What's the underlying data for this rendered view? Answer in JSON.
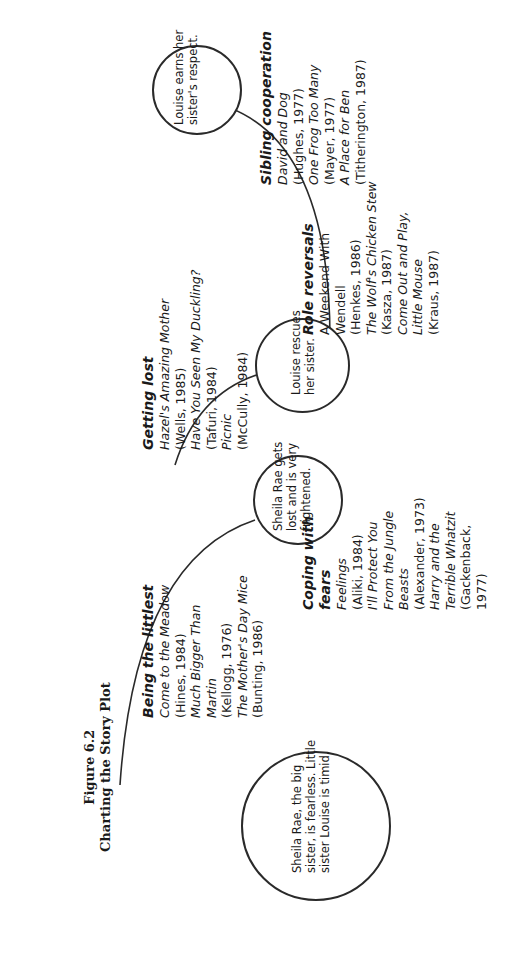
{
  "figure": {
    "number": "Figure 6.2",
    "title": "Charting the Story Plot"
  },
  "plot_nodes": [
    {
      "id": "n1",
      "text_lines": [
        "Sheila Rae, the big",
        "sister, is fearless. Little",
        "sister Louise is timid."
      ]
    },
    {
      "id": "n2",
      "text_lines": [
        "Sheila Rae gets",
        "lost and is very",
        "frightened."
      ]
    },
    {
      "id": "n3",
      "text_lines": [
        "Louise rescues",
        "her sister."
      ]
    },
    {
      "id": "n4",
      "text_lines": [
        "Louise earns her",
        "sister's respect."
      ]
    }
  ],
  "themes": [
    {
      "heading": "Being the littlest",
      "lines": [
        {
          "text": "Come to the Meadow",
          "italic": true
        },
        {
          "text": "(Hines, 1984)",
          "italic": false
        },
        {
          "text": "Much Bigger Than",
          "italic": true
        },
        {
          "text": "Martin",
          "italic": true
        },
        {
          "text": "(Kellogg, 1976)",
          "italic": false
        },
        {
          "text": "The Mother's Day Mice",
          "italic": true
        },
        {
          "text": "(Bunting, 1986)",
          "italic": false
        }
      ]
    },
    {
      "heading": "Coping with fears",
      "heading_lines": [
        "Coping with",
        "fears"
      ],
      "lines": [
        {
          "text": "Feelings",
          "italic": true
        },
        {
          "text": "(Aliki, 1984)",
          "italic": false
        },
        {
          "text": "I'll Protect You",
          "italic": true
        },
        {
          "text": "From the Jungle",
          "italic": true
        },
        {
          "text": "Beasts",
          "italic": true
        },
        {
          "text": "(Alexander, 1973)",
          "italic": false
        },
        {
          "text": "Harry and the",
          "italic": true
        },
        {
          "text": "Terrible Whatzit",
          "italic": true
        },
        {
          "text": "(Gackenback,",
          "italic": false
        },
        {
          "text": "1977)",
          "italic": false
        }
      ]
    },
    {
      "heading": "Getting lost",
      "lines": [
        {
          "text": "Hazel's Amazing Mother",
          "italic": true
        },
        {
          "text": "(Wells, 1985)",
          "italic": false
        },
        {
          "text": "Have You Seen My Duckling?",
          "italic": true
        },
        {
          "text": "(Tafuri, 1984)",
          "italic": false
        },
        {
          "text": "Picnic",
          "italic": true
        },
        {
          "text": "(McCully, 1984)",
          "italic": false
        }
      ]
    },
    {
      "heading": "Role reversals",
      "lines": [
        {
          "text": "A Weekend With",
          "italic": false
        },
        {
          "text": "Wendell",
          "italic": false
        },
        {
          "text": "(Henkes, 1986)",
          "italic": false
        },
        {
          "text": "The Wolf's Chicken Stew",
          "italic": true
        },
        {
          "text": "(Kasza, 1987)",
          "italic": false
        },
        {
          "text": "Come Out and Play,",
          "italic": true
        },
        {
          "text": "Little Mouse",
          "italic": true
        },
        {
          "text": "(Kraus, 1987)",
          "italic": false
        }
      ]
    },
    {
      "heading": "Sibling cooperation",
      "lines": [
        {
          "text": "David and Dog",
          "italic": true
        },
        {
          "text": "(Hughes, 1977)",
          "italic": false
        },
        {
          "text": "One Frog Too Many",
          "italic": true
        },
        {
          "text": "(Mayer, 1977)",
          "italic": false
        },
        {
          "text": "A Place for Ben",
          "italic": true
        },
        {
          "text": "(Titherington, 1987)",
          "italic": false
        }
      ]
    }
  ]
}
